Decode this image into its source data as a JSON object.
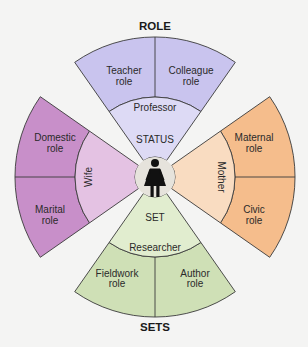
{
  "diagram": {
    "title_top": "ROLE",
    "title_bottom": "SETS",
    "center_icon": "woman-figure-icon",
    "inner_labels": {
      "status": "STATUS",
      "set": "SET"
    },
    "sectors": [
      {
        "name": "professor",
        "status_label": "Professor",
        "color": "#cfcbee",
        "roles": [
          {
            "line1": "Teacher",
            "line2": "role"
          },
          {
            "line1": "Colleague",
            "line2": "role"
          }
        ]
      },
      {
        "name": "mother",
        "status_label": "Mother",
        "color": "#f7c59a",
        "roles": [
          {
            "line1": "Maternal",
            "line2": "role"
          },
          {
            "line1": "Civic",
            "line2": "role"
          }
        ]
      },
      {
        "name": "researcher",
        "status_label": "Researcher",
        "color": "#d3e3bd",
        "roles": [
          {
            "line1": "Fieldwork",
            "line2": "role"
          },
          {
            "line1": "Author",
            "line2": "role"
          }
        ]
      },
      {
        "name": "wife",
        "status_label": "Wife",
        "color": "#cf9fd0",
        "roles": [
          {
            "line1": "Domestic",
            "line2": "role"
          },
          {
            "line1": "Marital",
            "line2": "role"
          }
        ]
      }
    ],
    "colors": {
      "professor_outer": "#c9c4ee",
      "professor_inner": "#dddaf5",
      "mother_outer": "#f5bd8c",
      "mother_inner": "#f9dcc1",
      "researcher_outer": "#cfe0b6",
      "researcher_inner": "#e1edcf",
      "wife_outer": "#c88fc9",
      "wife_inner": "#e4c2e3",
      "center": "#e6e3dc",
      "line": "#3a3a3a"
    }
  }
}
